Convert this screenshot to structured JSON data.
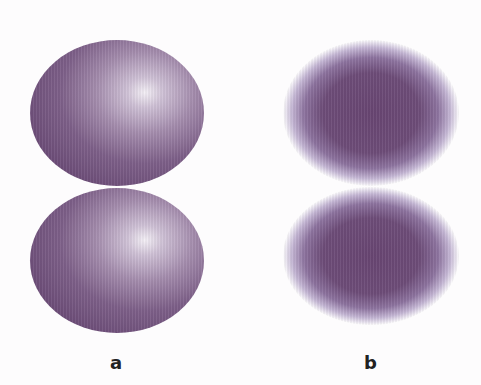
{
  "figure": {
    "panels": [
      {
        "label": "a",
        "description": "Two ovals with sharp edges and a specular highlight (3D shaded spheres)",
        "shapes": [
          {
            "position": "top",
            "style": "shaded-highlight"
          },
          {
            "position": "bottom",
            "style": "shaded-highlight"
          }
        ]
      },
      {
        "label": "b",
        "description": "Two ovals with soft blurred edges and uniform dark centers",
        "shapes": [
          {
            "position": "top",
            "style": "soft-edge"
          },
          {
            "position": "bottom",
            "style": "soft-edge"
          }
        ]
      }
    ],
    "colors": {
      "oval_dark": "#6a4a76",
      "oval_mid": "#a48cad",
      "highlight": "#f4f0f6",
      "background": "#fdfcfd",
      "label": "#222222"
    }
  }
}
